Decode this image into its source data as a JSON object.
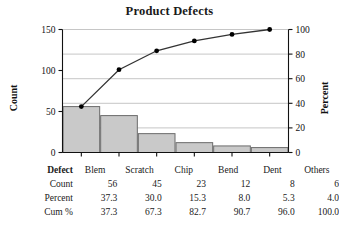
{
  "chart_data": {
    "type": "bar",
    "title": "Product Defects",
    "categories": [
      "Blem",
      "Scratch",
      "Chip",
      "Bend",
      "Dent",
      "Others"
    ],
    "values": [
      56,
      45,
      23,
      12,
      8,
      6
    ],
    "series": [
      {
        "name": "Count",
        "values": [
          56,
          45,
          23,
          12,
          8,
          6
        ]
      },
      {
        "name": "Cum %",
        "values": [
          37.3,
          67.3,
          82.7,
          90.7,
          96.0,
          100.0
        ]
      }
    ],
    "percent": [
      37.3,
      30.0,
      15.3,
      8.0,
      5.3,
      4.0
    ],
    "xlabel": "",
    "ylabel": "Count",
    "y2label": "Percent",
    "ylim": [
      0,
      150
    ],
    "y2lim": [
      0,
      100
    ],
    "yticks": [
      "0",
      "50",
      "100",
      "150"
    ],
    "ytick_values": [
      0,
      50,
      100,
      150
    ],
    "y2ticks": [
      "0",
      "20",
      "40",
      "60",
      "80",
      "100"
    ],
    "y2tick_values": [
      0,
      20,
      40,
      60,
      80,
      100
    ],
    "grid": true,
    "legend": "none",
    "bar_fill": "#c9c9c9",
    "bar_stroke": "#6b6b6b",
    "line_color": "#333333",
    "marker_color": "#000000"
  },
  "axes": {
    "left_title": "Count",
    "right_title": "Percent"
  },
  "table": {
    "rows": [
      {
        "label": "Defect",
        "values": [
          "Blem",
          "Scratch",
          "Chip",
          "Bend",
          "Dent",
          "Others"
        ]
      },
      {
        "label": "Count",
        "values": [
          "56",
          "45",
          "23",
          "12",
          "8",
          "6"
        ]
      },
      {
        "label": "Percent",
        "values": [
          "37.3",
          "30.0",
          "15.3",
          "8.0",
          "5.3",
          "4.0"
        ]
      },
      {
        "label": "Cum %",
        "values": [
          "37.3",
          "67.3",
          "82.7",
          "90.7",
          "96.0",
          "100.0"
        ]
      }
    ]
  }
}
